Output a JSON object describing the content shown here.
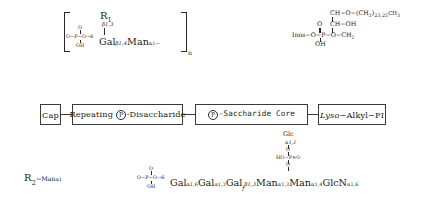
{
  "diagram": {
    "colors": {
      "box_border": "#3a3a3a",
      "dashed_leader": "#9a9a9a",
      "text": "#1a1a1a",
      "background": "#ffffff"
    }
  },
  "backbone": {
    "boxes": [
      {
        "id": "cap",
        "label": "Cap"
      },
      {
        "id": "repeat",
        "label_pre": "Repeating ",
        "phosphate": "P",
        "label_post": "-Disaccharide"
      },
      {
        "id": "core",
        "phosphate": "P",
        "label_post": "-Saccharide Core"
      },
      {
        "id": "lysoalkyl",
        "label_italic": "Lyso",
        "label_rest": "−Alkyl−PI"
      }
    ]
  },
  "repeating_unit": {
    "r1_label": "R",
    "r1_sub": "1",
    "r1_linkage": "β1,3",
    "phosphate": {
      "top": "O",
      "center": "P",
      "bottom": "OH",
      "left": "O−",
      "right": "−O→6"
    },
    "residue_1": "Gal",
    "linkage_1": "β1,4",
    "residue_2": "Man",
    "linkage_2": "α1−",
    "repeat_count": "n"
  },
  "cap_detail": {
    "r2_label": "R",
    "r2_sub": "2",
    "arrow": "→",
    "residue": "Man",
    "linkage": "α1"
  },
  "core_detail": {
    "branch": {
      "residue": "Glc",
      "linkage": "α1,1",
      "o_top": "O",
      "phosphate_left": "HO−",
      "phosphate_center": "P",
      "phosphate_right": "=O",
      "o_bottom": "O"
    },
    "phosphate": {
      "top": "O",
      "center": "P",
      "bottom": "OH",
      "left": "O−",
      "right": "−O→6"
    },
    "chain": [
      {
        "residue": "Gal",
        "italic_sub": "",
        "linkage": "α1,6"
      },
      {
        "residue": "Gal",
        "italic_sub": "",
        "linkage": "α1,3"
      },
      {
        "residue": "Gal",
        "italic_sub": "f",
        "linkage": "β1,3"
      },
      {
        "residue": "Man",
        "italic_sub": "",
        "linkage": "α1,3"
      },
      {
        "residue": "Man",
        "italic_sub": "",
        "linkage": "α1,4"
      },
      {
        "residue": "GlcN",
        "italic_sub": "",
        "linkage": "α1,6"
      }
    ]
  },
  "lipid_detail": {
    "inositol": "Inos−O−",
    "phosphate_center": "P",
    "phosphate_top": "O",
    "phosphate_bottom": "OH",
    "phosphate_right": "−O−",
    "glycerol_c3": "CH",
    "glycerol_c3_sub": "2",
    "glycerol_c2": "CH−OH",
    "glycerol_c1": "CH−O−",
    "alkyl_open": "(CH",
    "alkyl_sub": "2",
    "alkyl_close": ")",
    "alkyl_length": "23,25",
    "alkyl_terminal": "CH",
    "alkyl_terminal_sub": "3"
  }
}
